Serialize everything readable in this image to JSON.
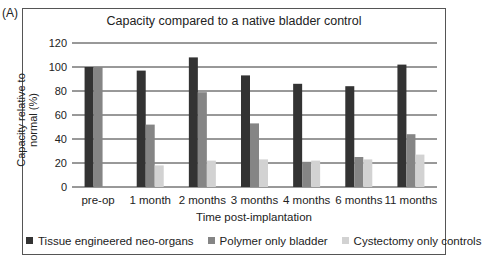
{
  "panel_label": "(A)",
  "chart_data": {
    "type": "bar",
    "title": "Capacity compared to a native bladder control",
    "xlabel": "Time post-implantation",
    "ylabel": "Capacity relative to normal (%)",
    "ylim": [
      0,
      120
    ],
    "yticks": [
      0,
      20,
      40,
      60,
      80,
      100,
      120
    ],
    "grid": true,
    "legend_position": "bottom",
    "categories": [
      "pre-op",
      "1 month",
      "2 months",
      "3 months",
      "4 months",
      "6 months",
      "11 months"
    ],
    "series": [
      {
        "name": "Tissue engineered neo-organs",
        "color": "#333333",
        "values": [
          100,
          97,
          108,
          93,
          86,
          84,
          102
        ]
      },
      {
        "name": "Polymer only bladder",
        "color": "#858585",
        "values": [
          100,
          52,
          79,
          53,
          21,
          25,
          44
        ]
      },
      {
        "name": "Cystectomy only controls",
        "color": "#d2d2d2",
        "values": [
          null,
          18,
          22,
          23,
          22,
          23,
          27
        ]
      }
    ]
  }
}
